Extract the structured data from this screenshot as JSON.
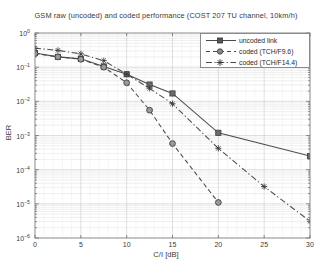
{
  "chart_data": {
    "type": "line",
    "title": "GSM raw (uncoded) and coded performance (COST 207 TU channel, 10km/h)",
    "xlabel": "C/I [dB]",
    "ylabel": "BER",
    "xlim": [
      0,
      30
    ],
    "ylim": [
      1e-06,
      1
    ],
    "yscale": "log",
    "xticks": [
      "0",
      "5",
      "10",
      "15",
      "20",
      "25",
      "30"
    ],
    "xtick_values": [
      0,
      5,
      10,
      15,
      20,
      25,
      30
    ],
    "yticks": [
      "10^0",
      "10^-1",
      "10^-2",
      "10^-3",
      "10^-4",
      "10^-5",
      "10^-6"
    ],
    "ytick_values": [
      1,
      0.1,
      0.01,
      0.001,
      0.0001,
      1e-05,
      1e-06
    ],
    "grid": true,
    "minor_grid": true,
    "legend_position": "upper right",
    "series": [
      {
        "name": "uncoded link",
        "linestyle": "solid",
        "marker": "square",
        "color": "#4a4a4a",
        "x": [
          0,
          2.5,
          5,
          7.5,
          10,
          12.5,
          15,
          20,
          30
        ],
        "y": [
          0.26,
          0.2,
          0.175,
          0.105,
          0.062,
          0.031,
          0.017,
          0.0012,
          0.00025
        ]
      },
      {
        "name": "coded (TCH/F9.6)",
        "linestyle": "dashed",
        "marker": "circle",
        "color": "#4a4a4a",
        "x": [
          0,
          2.5,
          5,
          7.5,
          10,
          12.5,
          15,
          20
        ],
        "y": [
          0.25,
          0.2,
          0.17,
          0.1,
          0.035,
          0.0055,
          0.00058,
          1.1e-05
        ]
      },
      {
        "name": "coded (TCH/F14.4)",
        "linestyle": "dashdot",
        "marker": "star",
        "color": "#4a4a4a",
        "x": [
          0,
          2.5,
          5,
          7.5,
          10,
          12.5,
          15,
          20,
          25,
          30
        ],
        "y": [
          0.36,
          0.31,
          0.245,
          0.155,
          0.062,
          0.024,
          0.0085,
          0.00042,
          3.2e-05,
          3.1e-06
        ]
      }
    ]
  },
  "legend": {
    "items": [
      {
        "label": "uncoded link"
      },
      {
        "label": "coded (TCH/F9.6)"
      },
      {
        "label": "coded (TCH/F14.4)"
      }
    ]
  }
}
